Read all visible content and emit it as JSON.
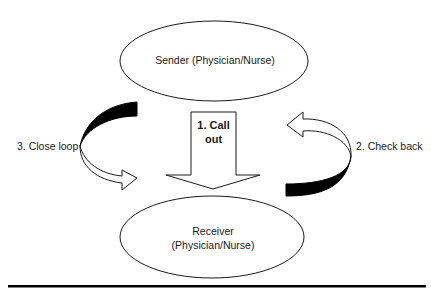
{
  "diagram": {
    "type": "closed-loop communication",
    "nodes": {
      "sender": {
        "label": "Sender (Physician/Nurse)"
      },
      "receiver": {
        "line1": "Receiver",
        "line2": "(Physician/Nurse)"
      }
    },
    "steps": {
      "call_out": {
        "line1": "1. Call",
        "line2": "out"
      },
      "check_back": {
        "label": "2. Check back"
      },
      "close_loop": {
        "label": "3. Close loop"
      }
    },
    "colors": {
      "stroke": "#1a1a1a",
      "fill": "#ffffff",
      "dark_fill": "#000000"
    }
  }
}
